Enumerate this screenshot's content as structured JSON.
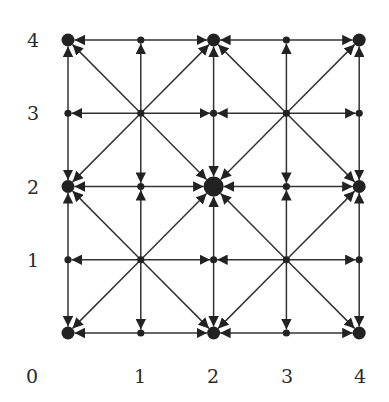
{
  "diagram": {
    "type": "directed-grid-graph",
    "grid": {
      "xmin": 0,
      "xmax": 4,
      "ymin": 0,
      "ymax": 4
    },
    "colors": {
      "line": "#333333",
      "node": "#222222",
      "label": "#2a2a2a",
      "background": "#ffffff"
    },
    "x_axis_labels": [
      {
        "text": "0",
        "px": 32
      },
      {
        "text": "1",
        "px": 140
      },
      {
        "text": "2",
        "px": 213
      },
      {
        "text": "3",
        "px": 287
      },
      {
        "text": "4",
        "px": 360
      }
    ],
    "y_axis_labels": [
      {
        "text": "4",
        "value": 4
      },
      {
        "text": "3",
        "value": 3
      },
      {
        "text": "2",
        "value": 2
      },
      {
        "text": "1",
        "value": 1
      }
    ],
    "nodes": [
      {
        "x": 0,
        "y": 0,
        "size": "large"
      },
      {
        "x": 1,
        "y": 0,
        "size": "small"
      },
      {
        "x": 2,
        "y": 0,
        "size": "large"
      },
      {
        "x": 3,
        "y": 0,
        "size": "small"
      },
      {
        "x": 4,
        "y": 0,
        "size": "large"
      },
      {
        "x": 0,
        "y": 1,
        "size": "small"
      },
      {
        "x": 1,
        "y": 1,
        "size": "small"
      },
      {
        "x": 2,
        "y": 1,
        "size": "small"
      },
      {
        "x": 3,
        "y": 1,
        "size": "small"
      },
      {
        "x": 4,
        "y": 1,
        "size": "small"
      },
      {
        "x": 0,
        "y": 2,
        "size": "large"
      },
      {
        "x": 1,
        "y": 2,
        "size": "small"
      },
      {
        "x": 2,
        "y": 2,
        "size": "xlarge"
      },
      {
        "x": 3,
        "y": 2,
        "size": "small"
      },
      {
        "x": 4,
        "y": 2,
        "size": "large"
      },
      {
        "x": 0,
        "y": 3,
        "size": "small"
      },
      {
        "x": 1,
        "y": 3,
        "size": "small"
      },
      {
        "x": 2,
        "y": 3,
        "size": "small"
      },
      {
        "x": 3,
        "y": 3,
        "size": "small"
      },
      {
        "x": 4,
        "y": 3,
        "size": "small"
      },
      {
        "x": 0,
        "y": 4,
        "size": "large"
      },
      {
        "x": 1,
        "y": 4,
        "size": "small"
      },
      {
        "x": 2,
        "y": 4,
        "size": "large"
      },
      {
        "x": 3,
        "y": 4,
        "size": "small"
      },
      {
        "x": 4,
        "y": 4,
        "size": "large"
      }
    ],
    "edges": [
      {
        "from": [
          1,
          0
        ],
        "to": [
          0,
          0
        ]
      },
      {
        "from": [
          1,
          0
        ],
        "to": [
          2,
          0
        ]
      },
      {
        "from": [
          3,
          0
        ],
        "to": [
          2,
          0
        ]
      },
      {
        "from": [
          3,
          0
        ],
        "to": [
          4,
          0
        ]
      },
      {
        "from": [
          1,
          1
        ],
        "to": [
          0,
          1
        ]
      },
      {
        "from": [
          1,
          1
        ],
        "to": [
          2,
          1
        ]
      },
      {
        "from": [
          3,
          1
        ],
        "to": [
          2,
          1
        ]
      },
      {
        "from": [
          3,
          1
        ],
        "to": [
          4,
          1
        ]
      },
      {
        "from": [
          1,
          2
        ],
        "to": [
          0,
          2
        ]
      },
      {
        "from": [
          1,
          2
        ],
        "to": [
          2,
          2
        ]
      },
      {
        "from": [
          3,
          2
        ],
        "to": [
          2,
          2
        ]
      },
      {
        "from": [
          3,
          2
        ],
        "to": [
          4,
          2
        ]
      },
      {
        "from": [
          1,
          3
        ],
        "to": [
          0,
          3
        ]
      },
      {
        "from": [
          1,
          3
        ],
        "to": [
          2,
          3
        ]
      },
      {
        "from": [
          3,
          3
        ],
        "to": [
          2,
          3
        ]
      },
      {
        "from": [
          3,
          3
        ],
        "to": [
          4,
          3
        ]
      },
      {
        "from": [
          1,
          4
        ],
        "to": [
          0,
          4
        ]
      },
      {
        "from": [
          1,
          4
        ],
        "to": [
          2,
          4
        ]
      },
      {
        "from": [
          3,
          4
        ],
        "to": [
          2,
          4
        ]
      },
      {
        "from": [
          3,
          4
        ],
        "to": [
          4,
          4
        ]
      },
      {
        "from": [
          0,
          1
        ],
        "to": [
          0,
          0
        ]
      },
      {
        "from": [
          0,
          1
        ],
        "to": [
          0,
          2
        ]
      },
      {
        "from": [
          0,
          3
        ],
        "to": [
          0,
          2
        ]
      },
      {
        "from": [
          0,
          3
        ],
        "to": [
          0,
          4
        ]
      },
      {
        "from": [
          1,
          1
        ],
        "to": [
          1,
          0
        ]
      },
      {
        "from": [
          1,
          1
        ],
        "to": [
          1,
          2
        ]
      },
      {
        "from": [
          1,
          3
        ],
        "to": [
          1,
          2
        ]
      },
      {
        "from": [
          1,
          3
        ],
        "to": [
          1,
          4
        ]
      },
      {
        "from": [
          2,
          1
        ],
        "to": [
          2,
          0
        ]
      },
      {
        "from": [
          2,
          1
        ],
        "to": [
          2,
          2
        ]
      },
      {
        "from": [
          2,
          3
        ],
        "to": [
          2,
          2
        ]
      },
      {
        "from": [
          2,
          3
        ],
        "to": [
          2,
          4
        ]
      },
      {
        "from": [
          3,
          1
        ],
        "to": [
          3,
          0
        ]
      },
      {
        "from": [
          3,
          1
        ],
        "to": [
          3,
          2
        ]
      },
      {
        "from": [
          3,
          3
        ],
        "to": [
          3,
          2
        ]
      },
      {
        "from": [
          3,
          3
        ],
        "to": [
          3,
          4
        ]
      },
      {
        "from": [
          4,
          1
        ],
        "to": [
          4,
          0
        ]
      },
      {
        "from": [
          4,
          1
        ],
        "to": [
          4,
          2
        ]
      },
      {
        "from": [
          4,
          3
        ],
        "to": [
          4,
          2
        ]
      },
      {
        "from": [
          4,
          3
        ],
        "to": [
          4,
          4
        ]
      },
      {
        "from": [
          1,
          1
        ],
        "to": [
          0,
          0
        ]
      },
      {
        "from": [
          1,
          1
        ],
        "to": [
          2,
          2
        ]
      },
      {
        "from": [
          1,
          1
        ],
        "to": [
          0,
          2
        ]
      },
      {
        "from": [
          1,
          1
        ],
        "to": [
          2,
          0
        ]
      },
      {
        "from": [
          3,
          1
        ],
        "to": [
          2,
          0
        ]
      },
      {
        "from": [
          3,
          1
        ],
        "to": [
          4,
          2
        ]
      },
      {
        "from": [
          3,
          1
        ],
        "to": [
          2,
          2
        ]
      },
      {
        "from": [
          3,
          1
        ],
        "to": [
          4,
          0
        ]
      },
      {
        "from": [
          1,
          3
        ],
        "to": [
          0,
          2
        ]
      },
      {
        "from": [
          1,
          3
        ],
        "to": [
          2,
          4
        ]
      },
      {
        "from": [
          1,
          3
        ],
        "to": [
          0,
          4
        ]
      },
      {
        "from": [
          1,
          3
        ],
        "to": [
          2,
          2
        ]
      },
      {
        "from": [
          3,
          3
        ],
        "to": [
          2,
          2
        ]
      },
      {
        "from": [
          3,
          3
        ],
        "to": [
          4,
          4
        ]
      },
      {
        "from": [
          3,
          3
        ],
        "to": [
          2,
          4
        ]
      },
      {
        "from": [
          3,
          3
        ],
        "to": [
          4,
          2
        ]
      }
    ]
  }
}
